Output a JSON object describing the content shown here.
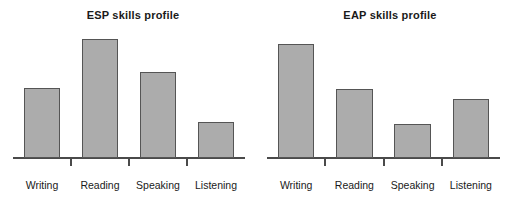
{
  "figure": {
    "background_color": "#ffffff",
    "bar_fill_color": "#acacac",
    "bar_outline_color": "#555555",
    "axis_color": "#4a4a4a",
    "text_color": "#1a1a1a"
  },
  "chart_data": [
    {
      "type": "bar",
      "title": "ESP skills profile",
      "xlabel": "",
      "ylabel": "",
      "grid": false,
      "legend": "none",
      "ylim": [
        0,
        130
      ],
      "categories": [
        "Writing",
        "Reading",
        "Speaking",
        "Listening"
      ],
      "values": [
        70,
        119,
        86,
        36
      ],
      "tick_labels": [
        "Writing",
        "Reading",
        "Speaking",
        "Listening"
      ]
    },
    {
      "type": "bar",
      "title": "EAP skills profile",
      "xlabel": "",
      "ylabel": "",
      "grid": false,
      "legend": "none",
      "ylim": [
        0,
        130
      ],
      "categories": [
        "Writing",
        "Reading",
        "Speaking",
        "Listening"
      ],
      "values": [
        114,
        69,
        34,
        59
      ],
      "tick_labels": [
        "Writing",
        "Reading",
        "Speaking",
        "Listening"
      ]
    }
  ]
}
